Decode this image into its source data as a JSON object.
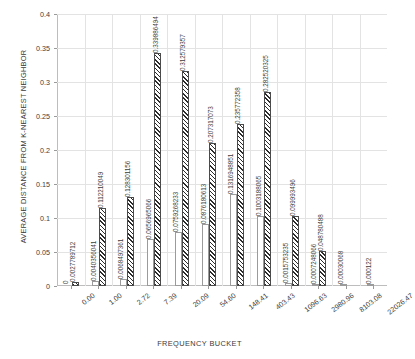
{
  "chart_data": {
    "type": "bar",
    "title": "",
    "xlabel": "FREQUENCY BUCKET",
    "ylabel": "AVERAGE DISTANCE FROM K-NEAREST NEIGHBOR",
    "ylim": [
      0,
      0.4
    ],
    "ytick_labels": [
      "0",
      "0.05",
      "0.1",
      "0.15",
      "0.2",
      "0.25",
      "0.3",
      "0.35",
      "0.4"
    ],
    "ytick_values": [
      0,
      0.05,
      0.1,
      0.15,
      0.2,
      0.25,
      0.3,
      0.35,
      0.4
    ],
    "grid": true,
    "legend": "none",
    "categories": [
      "0.00",
      "1.00",
      "2.72",
      "7.39",
      "20.09",
      "54.60",
      "148.41",
      "403.43",
      "1096.63",
      "2980.96",
      "8103.08",
      "22026.47"
    ],
    "series": [
      {
        "name": "dotted",
        "values": [
          0,
          0.0040356041,
          0.0068497361,
          0.0656965066,
          0.0759268233,
          0.0876180613,
          0.1316948851,
          0.1003188065,
          0.0015753235,
          0.0007248066,
          0.00030068,
          0.000122
        ],
        "labels": [
          "0",
          "0.0040356041",
          "0.0068497361",
          "0.0656965066",
          "0.0759268233",
          "0.0876180613",
          "0.1316948851",
          "0.1003188065",
          "0.0015753235",
          "0.0007248066",
          "0.00030068",
          "0.000122"
        ]
      },
      {
        "name": "hatched",
        "values": [
          0.0027789712,
          0.112210049,
          0.128301156,
          0.339886494,
          0.3125790357,
          0.207317073,
          0.235772358,
          0.282520325,
          0.099993496,
          0.048780488,
          0,
          0
        ],
        "labels": [
          "0.0027789712",
          "0.112210049",
          "0.128301156",
          "0.339886494",
          "0.312579357",
          "0.207317073",
          "0.235772358",
          "0.282520325",
          "0.099993496",
          "0.048780488",
          "",
          ""
        ]
      }
    ],
    "extra_labels": [
      "0.0031486605",
      "0.001375235"
    ]
  }
}
